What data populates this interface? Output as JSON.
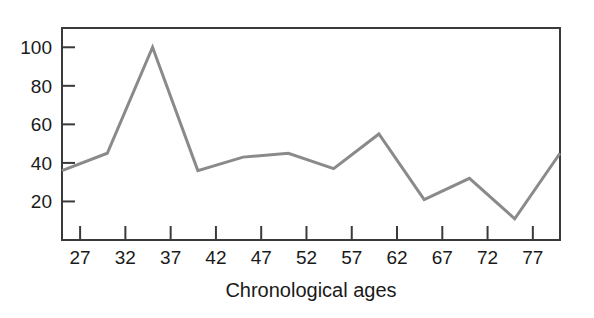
{
  "figure": {
    "background_color": "#ffffff",
    "frame_color": "#3a3a3a",
    "axis_label": "Chronological ages"
  },
  "chart_data": {
    "type": "line",
    "title": "",
    "xlabel": "Chronological ages",
    "ylabel": "",
    "x": [
      25,
      30,
      35,
      40,
      45,
      50,
      55,
      60,
      65,
      70,
      75,
      80
    ],
    "values": [
      36,
      45,
      100,
      36,
      43,
      45,
      37,
      55,
      21,
      32,
      11,
      45
    ],
    "series": [
      {
        "name": "score",
        "values": [
          36,
          45,
          100,
          36,
          43,
          45,
          37,
          55,
          21,
          32,
          11,
          45
        ],
        "color": "#8a8a8a"
      }
    ],
    "xlim": [
      25,
      80
    ],
    "ylim": [
      0,
      110
    ],
    "xticks": [
      27,
      32,
      37,
      42,
      47,
      52,
      57,
      62,
      67,
      72,
      77
    ],
    "xtick_labels": [
      "27",
      "32",
      "37",
      "42",
      "47",
      "52",
      "57",
      "62",
      "67",
      "72",
      "77"
    ],
    "yticks": [
      20,
      40,
      60,
      80,
      100
    ],
    "ytick_labels": [
      "20",
      "40",
      "60",
      "80",
      "100"
    ],
    "grid": false,
    "legend": null,
    "legend_position": "none",
    "line_color": "#8a8a8a",
    "line_width": 3
  }
}
